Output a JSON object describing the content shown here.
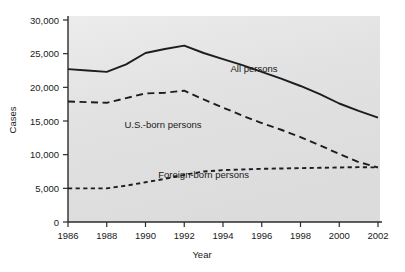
{
  "figure": {
    "background_color": "#ffffff",
    "plot_background_color": "#e3e3e3",
    "line_color": "#1d1d1d"
  },
  "chart_data": {
    "type": "line",
    "title": "",
    "xlabel": "Year",
    "ylabel": "Cases",
    "xlim": [
      1986,
      2002
    ],
    "ylim": [
      0,
      30000
    ],
    "grid": false,
    "legend_position": "inline-annotations",
    "x_tick_labels": [
      "1986",
      "1988",
      "1990",
      "1992",
      "1994",
      "1996",
      "1998",
      "2000",
      "2002"
    ],
    "x_ticks": [
      1986,
      1988,
      1990,
      1992,
      1994,
      1996,
      1998,
      2000,
      2002
    ],
    "y_tick_labels": [
      "0",
      "5,000",
      "10,000",
      "15,000",
      "20,000",
      "25,000",
      "30,000"
    ],
    "y_ticks": [
      0,
      5000,
      10000,
      15000,
      20000,
      25000,
      30000
    ],
    "x": [
      1986,
      1987,
      1988,
      1989,
      1990,
      1991,
      1992,
      1993,
      1994,
      1995,
      1996,
      1997,
      1998,
      1999,
      2000,
      2001,
      2002
    ],
    "series": [
      {
        "name": "All persons",
        "style": "solid",
        "label_x": 1995.6,
        "label_y": 22300,
        "values": [
          22700,
          22500,
          22300,
          23400,
          25100,
          25700,
          26200,
          25100,
          24200,
          23300,
          22300,
          21300,
          20200,
          19000,
          17600,
          16500,
          15500
        ]
      },
      {
        "name": "U.S.-born persons",
        "style": "dashed-long",
        "label_x": 1990.9,
        "label_y": 13900,
        "values": [
          17900,
          17800,
          17700,
          18400,
          19100,
          19200,
          19500,
          18200,
          17000,
          15800,
          14700,
          13700,
          12600,
          11400,
          10100,
          8900,
          8100
        ]
      },
      {
        "name": "Foreign-born persons",
        "style": "dashed-short",
        "label_x": 1993.0,
        "label_y": 6500,
        "values": [
          5000,
          5000,
          5000,
          5400,
          5900,
          6400,
          7000,
          7500,
          7700,
          7800,
          7900,
          7950,
          8000,
          8050,
          8100,
          8150,
          8100
        ]
      }
    ]
  },
  "artifact": {
    "text": "",
    "visible": true
  }
}
